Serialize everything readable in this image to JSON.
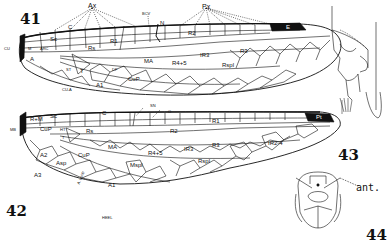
{
  "figures": {
    "fig41": {
      "number": "41",
      "subject": "forewing",
      "labels": {
        "ax": "Ax",
        "bcv": "BCV",
        "n": "N",
        "px": "Px",
        "e": "E",
        "cu": "CU",
        "c": "C",
        "sc": "Sc",
        "m": "M",
        "arc": "ARC",
        "r1": "R1",
        "rs": "Rs",
        "r2": "R2",
        "ir3": "IR3",
        "r3": "R3",
        "ma": "MA",
        "rs4_5": "R4+5",
        "rspl": "Rspl",
        "st": "ST",
        "t": "T",
        "df": "DF",
        "cup": "CuP",
        "a": "A",
        "a1": "A1",
        "cua": "CU-A"
      }
    },
    "fig42": {
      "number": "42",
      "subject": "hindwing",
      "labels": {
        "mb": "MB",
        "rm": "R+M",
        "sc": "Sc",
        "c": "C",
        "sn": "SN",
        "o": "O",
        "r1": "R1",
        "cup": "CuP",
        "ht": "HT",
        "t": "T",
        "rs": "Rs",
        "r2": "R2",
        "ma": "MA",
        "ir3": "IR3",
        "r3": "R3",
        "rs4_5": "R4+5",
        "rspl": "Rspl",
        "mspl": "Mspl",
        "ir2_4": "IR2-4",
        "pt": "Pt",
        "a2": "A2",
        "a3": "A3",
        "asp": "Asp",
        "cup2": "CuP",
        "a1": "A1",
        "anal_loop": "A. Loop",
        "heel": "HEEL"
      }
    },
    "fig43": {
      "number": "43",
      "subject": "abdominal appendage (lateral view)"
    },
    "fig44": {
      "number": "44",
      "subject": "head (frontal view)",
      "labels": {
        "ant": "ant."
      }
    }
  }
}
